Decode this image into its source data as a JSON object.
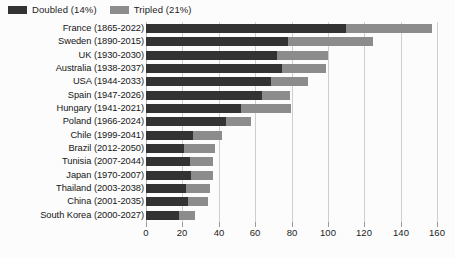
{
  "chart_data": {
    "type": "bar",
    "orientation": "horizontal",
    "stacked": false,
    "title": "",
    "subtitle": "",
    "xlabel": "",
    "ylabel": "",
    "xlim": [
      0,
      160
    ],
    "xticks": [
      0,
      20,
      40,
      60,
      80,
      100,
      120,
      140,
      160
    ],
    "xtick_labels": [
      "0",
      "20",
      "40",
      "60",
      "80",
      "100",
      "120",
      "140",
      "160"
    ],
    "grid": true,
    "grid_axis": "x",
    "legend_position": "top-left",
    "legend": [
      {
        "name": "Doubled (14%)",
        "color": "#333333"
      },
      {
        "name": "Tripled (21%)",
        "color": "#8c8c8c"
      }
    ],
    "categories": [
      "France (1865-2022)",
      "Sweden (1890-2015)",
      "UK (1930-2030)",
      "Australia (1938-2037)",
      "USA (1944-2033)",
      "Spain (1947-2026)",
      "Hungary (1941-2021)",
      "Poland (1966-2024)",
      "Chile (1999-2041)",
      "Brazil (2012-2050)",
      "Tunisia (2007-2044)",
      "Japan (1970-2007)",
      "Thailand (2003-2038)",
      "China (2001-2035)",
      "South Korea (2000-2027)"
    ],
    "series": [
      {
        "name": "Doubled (14%)",
        "color": "#333333",
        "values": [
          110,
          78,
          72,
          75,
          69,
          64,
          52,
          44,
          26,
          21,
          24,
          25,
          22,
          23,
          18
        ]
      },
      {
        "name": "Tripled (21%)",
        "color": "#8c8c8c",
        "values": [
          157,
          125,
          100,
          99,
          89,
          79,
          80,
          58,
          42,
          38,
          37,
          37,
          35,
          34,
          27
        ]
      }
    ]
  },
  "style": {
    "background": "#fcfcfc",
    "gridline_color": "#cfcfcf",
    "axis_color": "#b9b9b9",
    "text_color": "#161616"
  }
}
